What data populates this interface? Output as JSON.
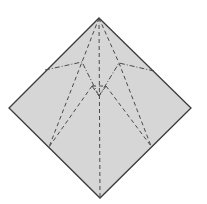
{
  "diagram": {
    "type": "origami-crease-pattern",
    "paper_color": "#d6d6d6",
    "edge_color": "#3a3a3a",
    "crease_color": "#4a4a4a",
    "outline": [
      [
        99,
        18
      ],
      [
        191,
        108
      ],
      [
        100,
        198
      ],
      [
        9,
        108
      ]
    ],
    "valley_folds": [
      [
        [
          99,
          18
        ],
        [
          100,
          198
        ]
      ],
      [
        [
          99,
          18
        ],
        [
          82,
          62
        ],
        [
          49,
          147
        ]
      ],
      [
        [
          99,
          18
        ],
        [
          119,
          63
        ],
        [
          151,
          146
        ]
      ],
      [
        [
          92,
          86
        ],
        [
          49,
          147
        ]
      ],
      [
        [
          106,
          86
        ],
        [
          151,
          146
        ]
      ],
      [
        [
          92,
          86
        ],
        [
          106,
          86
        ]
      ]
    ],
    "mountain_folds": [
      [
        [
          45,
          70
        ],
        [
          82,
          62
        ],
        [
          99,
          96
        ]
      ],
      [
        [
          154,
          71
        ],
        [
          119,
          63
        ],
        [
          99,
          96
        ]
      ],
      [
        [
          92,
          86
        ],
        [
          99,
          96
        ],
        [
          106,
          86
        ]
      ]
    ]
  }
}
